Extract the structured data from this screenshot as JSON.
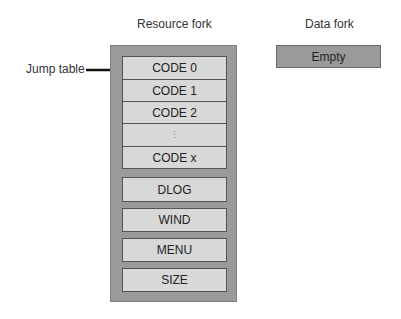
{
  "headers": {
    "resource_fork": "Resource fork",
    "data_fork": "Data fork"
  },
  "annotation": {
    "jump_table": "Jump table"
  },
  "resource_fork": {
    "code_segments": [
      {
        "label": "CODE 0"
      },
      {
        "label": "CODE 1"
      },
      {
        "label": "CODE 2"
      },
      {
        "label": "⋮"
      },
      {
        "label": "CODE x"
      }
    ],
    "resources": [
      {
        "label": "DLOG"
      },
      {
        "label": "WIND"
      },
      {
        "label": "MENU"
      },
      {
        "label": "SIZE"
      }
    ]
  },
  "data_fork": {
    "content": "Empty"
  },
  "colors": {
    "fork_fill": "#9a9a9a",
    "resource_fill": "#d8d8d8",
    "border": "#555555"
  }
}
